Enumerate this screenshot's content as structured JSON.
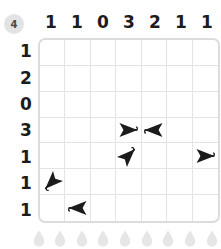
{
  "level": {
    "badge_label": "4",
    "badge_color": "#e3e3e3"
  },
  "board": {
    "columns": 7,
    "rows": 7,
    "grid_border_color": "#dcdcdc",
    "grid_line_color": "#e4e4e4",
    "column_clues": [
      "1",
      "1",
      "0",
      "3",
      "2",
      "1",
      "1"
    ],
    "row_clues": [
      "1",
      "2",
      "0",
      "3",
      "1",
      "1",
      "1"
    ],
    "arrow_color": "#1c1c1c",
    "arrows": [
      {
        "row": 4,
        "col": 4,
        "direction": "left",
        "icon": "arrow-left-icon"
      },
      {
        "row": 4,
        "col": 5,
        "direction": "right",
        "icon": "arrow-right-icon"
      },
      {
        "row": 5,
        "col": 4,
        "direction": "down-left",
        "icon": "arrow-down-left-icon"
      },
      {
        "row": 5,
        "col": 7,
        "direction": "left",
        "icon": "arrow-left-icon"
      },
      {
        "row": 6,
        "col": 1,
        "direction": "up-right",
        "icon": "arrow-up-right-icon"
      },
      {
        "row": 7,
        "col": 2,
        "direction": "right",
        "icon": "arrow-right-icon"
      }
    ]
  },
  "droplets": {
    "count": 9,
    "icon": "water-droplet-icon",
    "color": "#e6e6e6"
  }
}
